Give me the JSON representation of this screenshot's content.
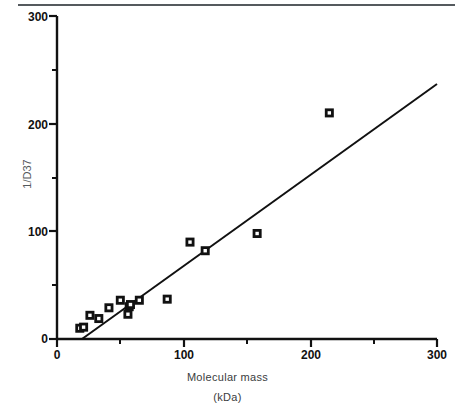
{
  "chart_data": {
    "type": "scatter",
    "title": "",
    "xlabel": "Molecular mass",
    "xlabel_unit": "(kDa)",
    "ylabel": "1/D37",
    "xlim": [
      0,
      300
    ],
    "ylim": [
      0,
      300
    ],
    "x_ticks": [
      0,
      100,
      200,
      300
    ],
    "x_tick_labels": [
      "0",
      "100",
      "200",
      "300"
    ],
    "x_minor_ticks": [
      50,
      150,
      250
    ],
    "y_ticks": [
      0,
      100,
      200,
      300
    ],
    "y_tick_labels": [
      "0",
      "100",
      "200",
      "300"
    ],
    "y_minor_ticks": [
      50,
      150,
      250
    ],
    "grid": false,
    "legend": null,
    "marker": "open-square",
    "points": [
      {
        "x": 18,
        "y": 10
      },
      {
        "x": 21,
        "y": 11
      },
      {
        "x": 26,
        "y": 22
      },
      {
        "x": 33,
        "y": 19
      },
      {
        "x": 41,
        "y": 29
      },
      {
        "x": 50,
        "y": 36
      },
      {
        "x": 56,
        "y": 23
      },
      {
        "x": 57,
        "y": 30
      },
      {
        "x": 58,
        "y": 32
      },
      {
        "x": 65,
        "y": 36
      },
      {
        "x": 87,
        "y": 37
      },
      {
        "x": 105,
        "y": 90
      },
      {
        "x": 117,
        "y": 82
      },
      {
        "x": 158,
        "y": 98
      },
      {
        "x": 215,
        "y": 210
      }
    ],
    "fit_line": {
      "type": "linear-regression",
      "x_start": 20,
      "y_start": 0,
      "x_end": 300,
      "y_end": 237
    }
  },
  "axes": {
    "y_label_300": "300",
    "y_label_200": "200",
    "y_label_100": "100",
    "y_label_0": "0",
    "x_label_0": "0",
    "x_label_100": "100",
    "x_label_200": "200",
    "x_label_300": "300"
  }
}
